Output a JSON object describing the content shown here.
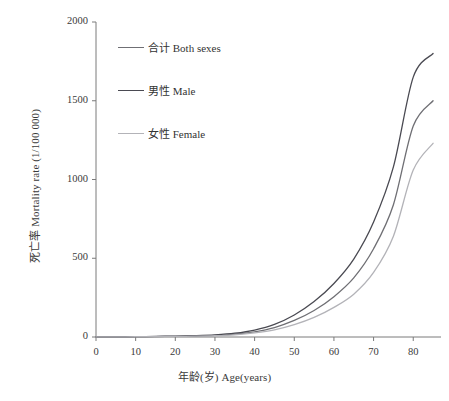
{
  "chart_data": {
    "type": "line",
    "title": "",
    "xlabel": "年龄(岁) Age(years)",
    "ylabel": "死亡率 Mortality rate (1/100 000)",
    "xlim": [
      0,
      87
    ],
    "ylim": [
      0,
      2000
    ],
    "xticks": [
      0,
      10,
      20,
      30,
      40,
      50,
      60,
      70,
      80
    ],
    "yticks": [
      0,
      500,
      1000,
      1500,
      2000
    ],
    "grid": false,
    "legend_position": "upper-left",
    "x": [
      0,
      5,
      10,
      15,
      20,
      25,
      30,
      35,
      40,
      45,
      50,
      55,
      60,
      65,
      70,
      75,
      80,
      85
    ],
    "series": [
      {
        "name": "合计 Both sexes",
        "label_cn": "合计",
        "label_en": "Both sexes",
        "color": "#6f6f74",
        "values": [
          1,
          1,
          2,
          3,
          4,
          6,
          10,
          18,
          33,
          60,
          105,
          168,
          256,
          375,
          560,
          840,
          1340,
          1500
        ]
      },
      {
        "name": "男性 Male",
        "label_cn": "男性",
        "label_en": "Male",
        "color": "#4a4a52",
        "values": [
          1,
          1,
          2,
          4,
          6,
          9,
          14,
          24,
          44,
          80,
          140,
          225,
          340,
          495,
          730,
          1080,
          1650,
          1800
        ]
      },
      {
        "name": "女性 Female",
        "label_cn": "女性",
        "label_en": "Female",
        "color": "#b3b3b8",
        "values": [
          1,
          1,
          2,
          3,
          4,
          5,
          8,
          14,
          26,
          45,
          78,
          124,
          188,
          272,
          410,
          640,
          1060,
          1230
        ]
      }
    ]
  }
}
